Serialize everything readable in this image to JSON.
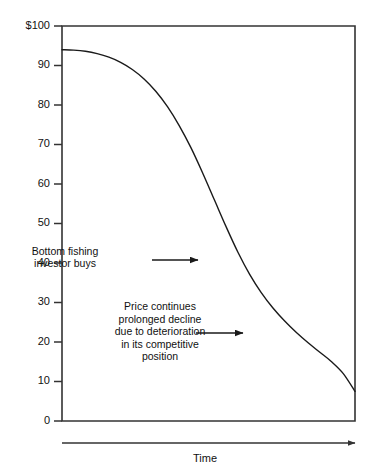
{
  "chart_data": {
    "type": "line",
    "title": "",
    "xlabel": "Time",
    "ylabel": "",
    "ylim": [
      0,
      100
    ],
    "grid": false,
    "legend": null,
    "y_tick_labels": [
      "$100",
      "90",
      "80",
      "70",
      "60",
      "50",
      "40",
      "30",
      "20",
      "10",
      "0"
    ],
    "y_tick_values": [
      100,
      90,
      80,
      70,
      60,
      50,
      40,
      30,
      20,
      10,
      0
    ],
    "x_tick_labels": [],
    "x_axis_arrow": true,
    "series": [
      {
        "name": "Price",
        "x": [
          0,
          4,
          8,
          12,
          16,
          20,
          24,
          28,
          32,
          36,
          40,
          44,
          48,
          52,
          56,
          60,
          64,
          68,
          72,
          76,
          80,
          84,
          88,
          92,
          96,
          100
        ],
        "values": [
          94,
          93.9,
          93.6,
          93.0,
          92.1,
          90.8,
          89.0,
          86.6,
          83.5,
          79.6,
          74.8,
          69.2,
          62.8,
          56.0,
          49.2,
          42.8,
          37.2,
          32.5,
          28.6,
          25.3,
          22.4,
          19.8,
          17.4,
          15.0,
          12.0,
          7.5
        ]
      }
    ],
    "annotations": [
      {
        "id": "bottom-fishing",
        "lines": [
          "Bottom  fishing",
          "investor  buys"
        ],
        "text_x": 65,
        "text_y": 255,
        "line_height": 12,
        "arrow_from_x": 152,
        "arrow_from_y": 260,
        "arrow_to_x": 198,
        "arrow_to_y": 260
      },
      {
        "id": "prolonged-decline",
        "lines": [
          "Price  continues",
          "prolonged  decline",
          "due  to  deterioration",
          "in  its  competitive",
          "position"
        ],
        "text_x": 160,
        "text_y": 310,
        "line_height": 12.5,
        "arrow_from_x": 196,
        "arrow_from_y": 333,
        "arrow_to_x": 243,
        "arrow_to_y": 333
      }
    ],
    "colors": {
      "line": "#1a1a1a",
      "axis": "#333333",
      "text": "#111111",
      "background": "#ffffff"
    },
    "geometry": {
      "plot_left": 62,
      "plot_right": 355,
      "plot_top": 26,
      "plot_bottom": 421,
      "time_axis_y": 443,
      "time_axis_left": 62,
      "time_axis_right": 355,
      "time_label_x": 205,
      "time_label_y": 462
    }
  }
}
